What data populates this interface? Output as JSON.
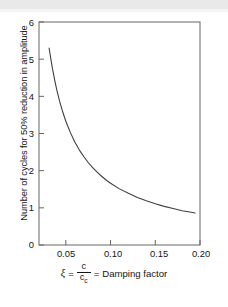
{
  "figure": {
    "background_color": "#ffffff",
    "frame_color": "#555555",
    "curve_color": "#404040"
  },
  "axes": {
    "y_label": "Number of cycles for 50% reduction in amplitude",
    "y_ticks": [
      "0",
      "1",
      "2",
      "3",
      "4",
      "5",
      "6"
    ],
    "x_ticks": [
      "0.05",
      "0.10",
      "0.15",
      "0.20"
    ]
  },
  "caption": {
    "symbol": "ξ",
    "equals_1": "=",
    "numerator": "c",
    "denominator": "c",
    "denominator_sub": "c",
    "equals_2": "=",
    "text": "Damping factor",
    "full_text": "ξ = c/c_c = Damping factor"
  },
  "chart_data": {
    "type": "line",
    "title": "",
    "subtitle": "",
    "xlabel": "ξ = c/c_c = Damping factor",
    "ylabel": "Number of cycles for 50% reduction in amplitude",
    "xlim": [
      0.02,
      0.2
    ],
    "ylim": [
      0,
      6
    ],
    "xticks": [
      0.05,
      0.1,
      0.15,
      0.2
    ],
    "yticks": [
      0,
      1,
      2,
      3,
      4,
      5,
      6
    ],
    "grid": false,
    "legend": null,
    "relation": "n = 0.11 / ξ",
    "series": [
      {
        "name": "cycles for 50% reduction",
        "x": [
          0.0313,
          0.033,
          0.035,
          0.038,
          0.04,
          0.043,
          0.046,
          0.05,
          0.055,
          0.06,
          0.065,
          0.07,
          0.075,
          0.08,
          0.085,
          0.09,
          0.095,
          0.1,
          0.11,
          0.12,
          0.13,
          0.14,
          0.15,
          0.16,
          0.17,
          0.18,
          0.19,
          0.1945
        ],
        "y": [
          5.3,
          5.04,
          4.75,
          4.38,
          4.16,
          3.87,
          3.62,
          3.33,
          3.03,
          2.77,
          2.56,
          2.38,
          2.22,
          2.08,
          1.96,
          1.85,
          1.75,
          1.66,
          1.51,
          1.39,
          1.28,
          1.19,
          1.11,
          1.04,
          0.98,
          0.92,
          0.88,
          0.86
        ]
      }
    ]
  }
}
